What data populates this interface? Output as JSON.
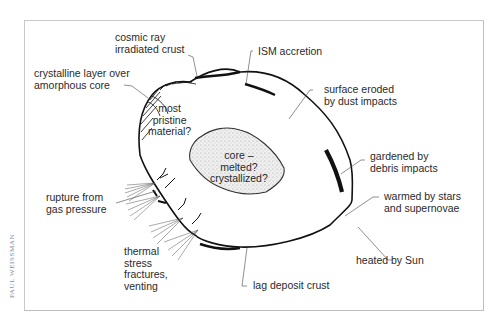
{
  "figure": {
    "credit": "PAUL WEISSMAN",
    "colors": {
      "background": "#ffffff",
      "frame": "#c8c8c8",
      "outline": "#111111",
      "core_fill": "#e4e4e4",
      "text": "#2a2a2a"
    }
  },
  "labels": {
    "cosmic_ray": "cosmic ray\nirradiated crust",
    "ism": "ISM accretion",
    "crystalline": "crystalline layer over\namorphous core",
    "surface_eroded": "surface eroded\nby dust impacts",
    "pristine": "most\npristine\nmaterial?",
    "core": "core –\nmelted?\ncrystallized?",
    "gardened": "gardened by\ndebris impacts",
    "rupture": "rupture from\ngas pressure",
    "warmed": "warmed by stars\nand supernovae",
    "thermal": "thermal\nstress\nfractures,\nventing",
    "heated": "heated by Sun",
    "lag": "lag deposit crust"
  }
}
